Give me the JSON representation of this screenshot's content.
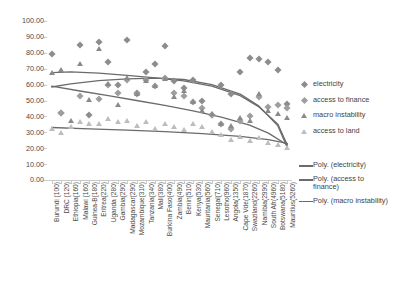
{
  "chart_data": {
    "type": "scatter",
    "title": "",
    "xlabel": "",
    "ylabel": "",
    "ylim": [
      0,
      100
    ],
    "ytick_labels": [
      "100.00",
      "90.00",
      "80.00",
      "70.00",
      "60.00",
      "50.00",
      "40.00",
      "30.00",
      "20.00",
      "10.00",
      "0.00"
    ],
    "ytick_values": [
      100,
      90,
      80,
      70,
      60,
      50,
      40,
      30,
      20,
      10,
      0
    ],
    "grid": false,
    "legend_position": "right",
    "categories": [
      "Burundi (100)",
      "DRC (120)",
      "Ethiopia(160)",
      "Malawi (160)",
      "Guinea-B(180)",
      "Eritrea(220)",
      "Uganda (280)",
      "Gambia(290)",
      "Madagascar(290)",
      "Mozambique(310)",
      "Tanzania(340)",
      "Mali(380)",
      "Burkina Faso(400)",
      "Zambia(490)",
      "Benin(510)",
      "Kenya(530)",
      "Mauritania(560)",
      "Senegal(710)",
      "Lesotho(960)",
      "Angola(1350)",
      "Cape Vde(1870)",
      "Swaziland(2260)",
      "Namibia(2990)",
      "South Afr(4960)",
      "Botswana(5180)",
      "Mauritius(5260)"
    ],
    "series": [
      {
        "name": "electricity",
        "marker": "diamond",
        "color": "#8c8c8c",
        "values": [
          79,
          42,
          null,
          85,
          41,
          87,
          74,
          60,
          88,
          55,
          68,
          73,
          84,
          62,
          58,
          63,
          50,
          41,
          60,
          54,
          68,
          77,
          76,
          74,
          69,
          48
        ]
      },
      {
        "name": "access to finance",
        "marker": "diamond",
        "color": "#9e9e9e",
        "values": [
          null,
          42,
          null,
          53,
          null,
          51,
          60,
          55,
          63,
          54,
          63,
          59,
          64,
          55,
          53,
          49,
          45,
          41,
          35,
          32,
          37,
          40,
          52,
          46,
          47,
          45
        ]
      },
      {
        "name": "macro instability",
        "marker": "triangle",
        "color": "#8a8a8a",
        "values": [
          66,
          68,
          36,
          72,
          49,
          81,
          59,
          46,
          63,
          53,
          61,
          58,
          62,
          51,
          55,
          48,
          42,
          40,
          34,
          33,
          38,
          36,
          53,
          42,
          40,
          38
        ]
      },
      {
        "name": "access to land",
        "marker": "triangle",
        "color": "#bdbdbd",
        "values": [
          31,
          28,
          32,
          35,
          34,
          34,
          37,
          35,
          36,
          33,
          35,
          31,
          34,
          32,
          30,
          34,
          32,
          29,
          27,
          24,
          26,
          23,
          25,
          22,
          21,
          19
        ]
      }
    ],
    "trendlines": [
      {
        "name": "Poly. (electricity)",
        "color": "#6b6b6b",
        "points": [
          [
            0,
            67.5
          ],
          [
            2,
            68.0
          ],
          [
            5,
            67.2
          ],
          [
            8,
            65.8
          ],
          [
            11,
            64.2
          ],
          [
            14,
            62.4
          ],
          [
            17,
            59.0
          ],
          [
            20,
            53.0
          ],
          [
            22,
            46.0
          ],
          [
            24,
            35.0
          ],
          [
            25,
            22.0
          ]
        ]
      },
      {
        "name": "Poly. (access to finance)",
        "color": "#6b6b6b",
        "points": [
          [
            0,
            58.5
          ],
          [
            2,
            60.5
          ],
          [
            5,
            62.5
          ],
          [
            8,
            63.6
          ],
          [
            11,
            64.0
          ],
          [
            14,
            63.2
          ],
          [
            17,
            60.0
          ],
          [
            20,
            54.0
          ],
          [
            22,
            46.5
          ],
          [
            24,
            34.0
          ],
          [
            25,
            20.5
          ]
        ]
      },
      {
        "name": "Poly. (macro instability)",
        "color": "#6b6b6b",
        "points": [
          [
            0,
            59.0
          ],
          [
            3,
            56.0
          ],
          [
            6,
            53.0
          ],
          [
            9,
            50.0
          ],
          [
            12,
            47.0
          ],
          [
            15,
            43.5
          ],
          [
            18,
            39.5
          ],
          [
            21,
            34.5
          ],
          [
            23,
            29.5
          ],
          [
            25,
            22.0
          ]
        ]
      },
      {
        "name": "",
        "color": "#6b6b6b",
        "points": [
          [
            0,
            33.0
          ],
          [
            4,
            32.2
          ],
          [
            8,
            31.4
          ],
          [
            12,
            30.4
          ],
          [
            16,
            29.2
          ],
          [
            20,
            27.4
          ],
          [
            23,
            25.4
          ],
          [
            25,
            23.0
          ]
        ]
      }
    ]
  },
  "legend": {
    "markers": [
      {
        "label": "electricity",
        "marker": "diamond",
        "color": "#8c8c8c"
      },
      {
        "label": "access to finance",
        "marker": "diamond",
        "color": "#9e9e9e"
      },
      {
        "label": "macro instability",
        "marker": "triangle",
        "color": "#8a8a8a"
      },
      {
        "label": "access to land",
        "marker": "triangle",
        "color": "#bdbdbd"
      }
    ],
    "lines": [
      {
        "label": "Poly. (electricity)",
        "color": "#6b6b6b"
      },
      {
        "label": "Poly. (access to finance)",
        "color": "#6b6b6b"
      },
      {
        "label": "Poly. (macro instability)",
        "color": "#6b6b6b"
      }
    ]
  }
}
